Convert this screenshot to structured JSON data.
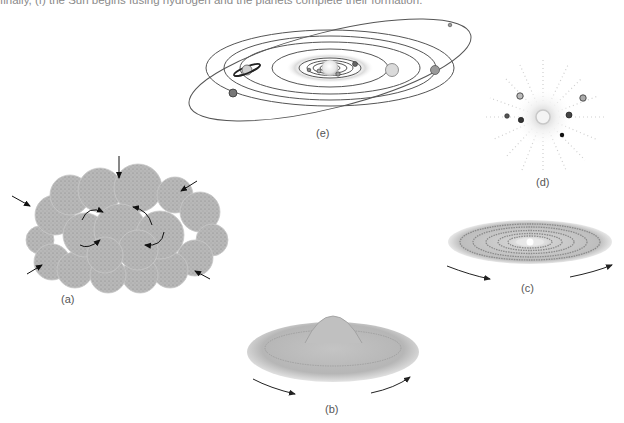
{
  "caption": {
    "text": "finally, (f) the Sun begins fusing hydrogen and the planets complete their formation."
  },
  "panels": {
    "a": {
      "label": "(a)",
      "description": "Rotating, collapsing gas cloud with inward arrows"
    },
    "b": {
      "label": "(b)",
      "description": "Flattened rotating disk with central bulge"
    },
    "c": {
      "label": "(c)",
      "description": "Rotating disk with concentric rings and bright center"
    },
    "d": {
      "label": "(d)",
      "description": "Young sun surrounded by planets clearing debris"
    },
    "e": {
      "label": "(e)",
      "description": "Formed solar system with planetary orbits"
    }
  },
  "colors": {
    "cloud_fill": "#b4b4b4",
    "cloud_dot": "#7a7a7a",
    "disk_fill": "#c2c2c2",
    "orbit_stroke": "#555555",
    "arrow": "#222222",
    "label": "#555555"
  }
}
